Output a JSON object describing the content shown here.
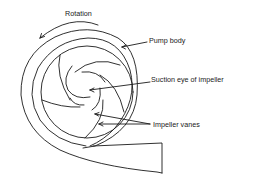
{
  "diagram": {
    "labels": {
      "rotation": "Rotation",
      "pump_body": "Pump body",
      "suction_eye": "Suction eye of impeller",
      "impeller_vanes": "Impeller vanes"
    },
    "colors": {
      "stroke": "#1a1a1a",
      "background": "#ffffff"
    }
  }
}
